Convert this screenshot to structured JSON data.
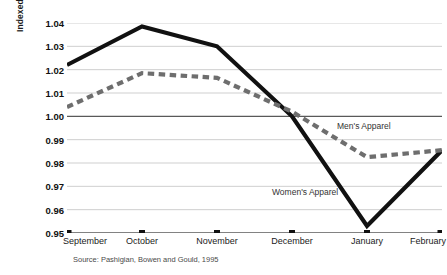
{
  "chart_data": {
    "type": "line",
    "title": "",
    "xlabel": "",
    "ylabel": "Indexed clothing price",
    "categories": [
      "September",
      "October",
      "November",
      "December",
      "January",
      "February"
    ],
    "ylim": [
      0.95,
      1.04
    ],
    "yticks": [
      "1.04",
      "1.03",
      "1.02",
      "1.01",
      "1.00",
      "0.99",
      "0.98",
      "0.97",
      "0.96",
      "0.95"
    ],
    "ytick_values": [
      1.04,
      1.03,
      1.02,
      1.01,
      1.0,
      0.99,
      0.98,
      0.97,
      0.96,
      0.95
    ],
    "grid": true,
    "grid_orientation": "horizontal",
    "baseline_value": 1.0,
    "legend_position": "inline-annotations",
    "series": [
      {
        "name": "Women's Apparel",
        "style": "solid",
        "color": "#111111",
        "width": 4.2,
        "values": [
          1.022,
          1.0385,
          1.03,
          1.0,
          0.953,
          0.9855
        ]
      },
      {
        "name": "Men's Apparel",
        "style": "dashed",
        "color": "#6e6e6e",
        "width": 4.2,
        "values": [
          1.004,
          1.0185,
          1.0165,
          1.002,
          0.9825,
          0.9855
        ]
      }
    ],
    "annotations": [
      {
        "text": "Men's Apparel",
        "series": "Men's Apparel"
      },
      {
        "text": "Women's Apparel",
        "series": "Women's Apparel"
      }
    ],
    "source": "Source: Pashigian, Bowen and Gould, 1995"
  },
  "axis": {
    "y_title": "Indexed clothing price"
  },
  "labels": {
    "mens": "Men's Apparel",
    "womens": "Women's Apparel"
  },
  "footer": {
    "source": "Source: Pashigian, Bowen and Gould, 1995"
  },
  "colors": {
    "womens_line": "#111111",
    "mens_line": "#6e6e6e",
    "gridline": "#c9c9c9",
    "baseline": "#595959",
    "axis": "#4a4a4a",
    "background": "#ffffff"
  }
}
